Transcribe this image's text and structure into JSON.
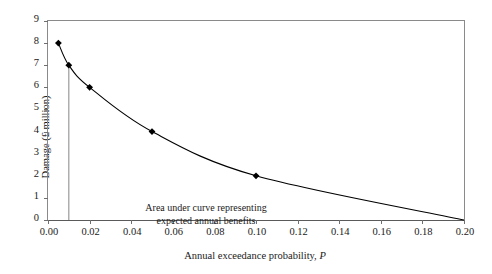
{
  "chart_data": {
    "type": "line",
    "title": "",
    "xlabel_prefix": "Annual exceedance probability, ",
    "xlabel_symbol": "P",
    "ylabel": "Damage (£ million)",
    "xlim": [
      0.0,
      0.2
    ],
    "ylim": [
      0,
      9
    ],
    "grid": false,
    "legend": "none",
    "xticks": [
      "0.00",
      "0.02",
      "0.04",
      "0.06",
      "0.08",
      "0.10",
      "0.12",
      "0.14",
      "0.16",
      "0.18",
      "0.20"
    ],
    "xtick_values": [
      0.0,
      0.02,
      0.04,
      0.06,
      0.08,
      0.1,
      0.12,
      0.14,
      0.16,
      0.18,
      0.2
    ],
    "yticks": [
      "0",
      "1",
      "2",
      "3",
      "4",
      "5",
      "6",
      "7",
      "8",
      "9"
    ],
    "ytick_values": [
      0,
      1,
      2,
      3,
      4,
      5,
      6,
      7,
      8,
      9
    ],
    "series": [
      {
        "name": "Damage curve",
        "marker": "diamond",
        "color": "#000000",
        "x": [
          0.005,
          0.01,
          0.02,
          0.05,
          0.1,
          0.2
        ],
        "y": [
          8,
          7,
          6,
          4,
          2,
          0
        ],
        "marked_points": [
          {
            "x": 0.005,
            "y": 8
          },
          {
            "x": 0.01,
            "y": 7
          },
          {
            "x": 0.02,
            "y": 6
          },
          {
            "x": 0.05,
            "y": 4
          },
          {
            "x": 0.1,
            "y": 2
          }
        ]
      }
    ],
    "vertical_line": {
      "name": "design-exceedance-line",
      "x": 0.01,
      "y_from": 0,
      "y_to": 7,
      "color": "#9a9a9a"
    },
    "annotations": [
      {
        "name": "area-under-curve-note",
        "line1": "Area under curve representing",
        "line2": "expected annual benefits",
        "x": 0.0275,
        "y": 1.55
      }
    ]
  },
  "colors": {
    "axis": "#6f6f6f",
    "frame": "#8a8a8a",
    "curve": "#000000",
    "marker": "#000000",
    "vline": "#9a9a9a",
    "text": "#1a1a1a",
    "background": "#ffffff"
  }
}
